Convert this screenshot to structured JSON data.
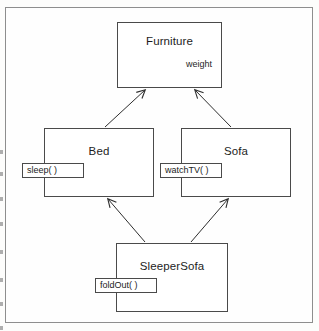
{
  "diagram": {
    "type": "uml-class-inheritance-diagram",
    "background_color": "#fdfdfc",
    "frame_color": "#8e8e8e",
    "node_border_color": "#4a4a4a",
    "node_fill_color": "#ffffff",
    "shadow_color": "#cfcfcf",
    "line_color": "#2e2e2e",
    "classes": [
      {
        "id": "furniture",
        "name": "Furniture",
        "attribute": "weight",
        "operation": null
      },
      {
        "id": "bed",
        "name": "Bed",
        "attribute": null,
        "operation": "sleep( )"
      },
      {
        "id": "sofa",
        "name": "Sofa",
        "attribute": null,
        "operation": "watchTV( )"
      },
      {
        "id": "sleepersofa",
        "name": "SleeperSofa",
        "attribute": null,
        "operation": "foldOut( )"
      }
    ],
    "relationships": [
      {
        "from": "Bed",
        "to": "Furniture",
        "kind": "inheritance"
      },
      {
        "from": "Sofa",
        "to": "Furniture",
        "kind": "inheritance"
      },
      {
        "from": "SleeperSofa",
        "to": "Bed",
        "kind": "inheritance"
      },
      {
        "from": "SleeperSofa",
        "to": "Sofa",
        "kind": "inheritance"
      }
    ]
  }
}
